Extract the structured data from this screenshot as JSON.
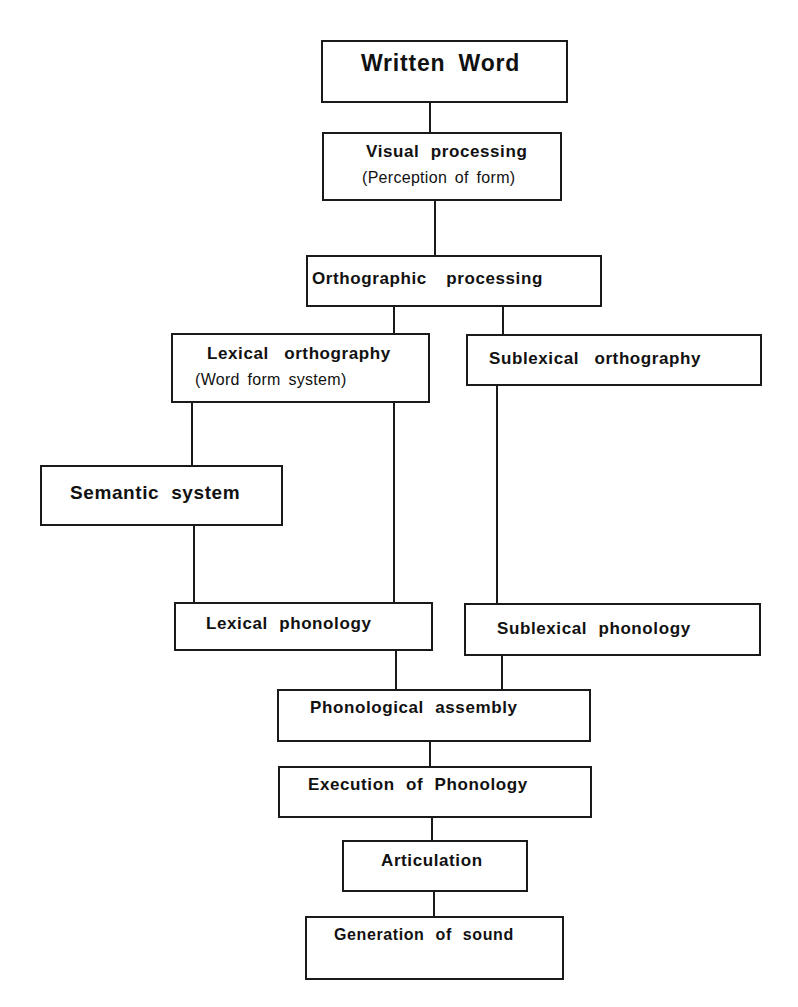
{
  "diagram": {
    "type": "flowchart",
    "nodes": {
      "written_word": {
        "label": "Written Word"
      },
      "visual": {
        "label": "Visual processing",
        "sublabel": "(Perception of form)"
      },
      "orthographic": {
        "label": "Orthographic processing"
      },
      "lex_orth": {
        "label": "Lexical orthography",
        "sublabel": "(Word form system)"
      },
      "sublex_orth": {
        "label": "Sublexical orthography"
      },
      "semantic": {
        "label": "Semantic system"
      },
      "lex_phon": {
        "label": "Lexical phonology"
      },
      "sublex_phon": {
        "label": "Sublexical phonology"
      },
      "assembly": {
        "label": "Phonological assembly"
      },
      "execution": {
        "label": "Execution of Phonology"
      },
      "articulation": {
        "label": "Articulation"
      },
      "generation": {
        "label": "Generation of sound"
      }
    },
    "edges": [
      [
        "Written Word",
        "Visual processing"
      ],
      [
        "Visual processing",
        "Orthographic processing"
      ],
      [
        "Orthographic processing",
        "Lexical orthography"
      ],
      [
        "Orthographic processing",
        "Sublexical orthography"
      ],
      [
        "Lexical orthography",
        "Semantic system"
      ],
      [
        "Lexical orthography",
        "Lexical phonology"
      ],
      [
        "Semantic system",
        "Lexical phonology"
      ],
      [
        "Sublexical orthography",
        "Sublexical phonology"
      ],
      [
        "Lexical phonology",
        "Phonological assembly"
      ],
      [
        "Sublexical phonology",
        "Phonological assembly"
      ],
      [
        "Phonological assembly",
        "Execution of Phonology"
      ],
      [
        "Execution of Phonology",
        "Articulation"
      ],
      [
        "Articulation",
        "Generation of sound"
      ]
    ]
  }
}
